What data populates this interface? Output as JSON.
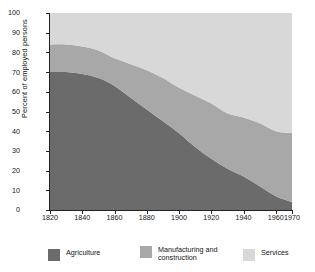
{
  "chart_data": {
    "type": "area",
    "title": "",
    "subtitle": "",
    "xlabel": "",
    "ylabel": "Percent of employed persons",
    "stacked": true,
    "grid": false,
    "legend_position": "bottom",
    "xlim": [
      1820,
      1970
    ],
    "ylim": [
      0,
      100
    ],
    "x": [
      1820,
      1830,
      1840,
      1850,
      1860,
      1870,
      1880,
      1890,
      1900,
      1910,
      1920,
      1930,
      1940,
      1950,
      1960,
      1970
    ],
    "xticks": [
      "1820",
      "1840",
      "1860",
      "1880",
      "1900",
      "1920",
      "1940",
      "1960",
      "1970"
    ],
    "xtick_values": [
      1820,
      1840,
      1860,
      1880,
      1900,
      1920,
      1940,
      1960,
      1970
    ],
    "yticks": [
      "0",
      "10",
      "20",
      "30",
      "40",
      "50",
      "60",
      "70",
      "80",
      "90",
      "100"
    ],
    "ytick_values": [
      0,
      10,
      20,
      30,
      40,
      50,
      60,
      70,
      80,
      90,
      100
    ],
    "series": [
      {
        "name": "Agriculture",
        "color": "#6b6b6b",
        "values": [
          70,
          70,
          69,
          67,
          63,
          57,
          51,
          45,
          39,
          32,
          26,
          21,
          17,
          12,
          7,
          4
        ]
      },
      {
        "name": "Manufacturing and construction",
        "color": "#a8a8a8",
        "values": [
          14,
          14,
          14,
          14,
          14,
          17,
          20,
          22,
          23,
          26,
          28,
          28,
          30,
          32,
          33,
          35
        ]
      },
      {
        "name": "Services",
        "color": "#d8d8d8",
        "values": [
          16,
          16,
          17,
          19,
          23,
          26,
          29,
          33,
          38,
          42,
          46,
          51,
          53,
          56,
          60,
          61
        ]
      }
    ],
    "cumulative_tops": {
      "agriculture": [
        70,
        70,
        69,
        67,
        63,
        57,
        51,
        45,
        39,
        32,
        26,
        21,
        17,
        12,
        7,
        4
      ],
      "agriculture_plus_manufacturing": [
        84,
        84,
        83,
        81,
        77,
        74,
        71,
        67,
        62,
        58,
        54,
        49,
        47,
        44,
        40,
        39
      ]
    }
  },
  "legend": {
    "items": [
      {
        "label": "Agriculture",
        "color": "#6b6b6b"
      },
      {
        "label": "Manufacturing and construction",
        "color": "#a8a8a8"
      },
      {
        "label": "Services",
        "color": "#d8d8d8"
      }
    ]
  },
  "axis": {
    "y_title": "Percent of employed persons"
  },
  "colors": {
    "plot_background": "#efefef",
    "axis": "#222222",
    "text": "#151515"
  }
}
